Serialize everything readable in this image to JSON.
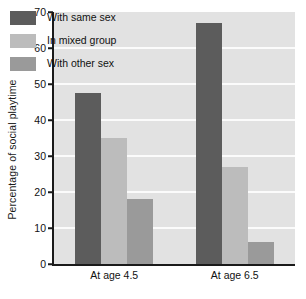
{
  "chart_data": {
    "type": "bar",
    "title": "",
    "subtitle": "",
    "xlabel": "",
    "ylabel": "Percentage of social playtime",
    "categories": [
      "At age 4.5",
      "At age 6.5"
    ],
    "series": [
      {
        "name": "With same sex",
        "values": [
          47.5,
          67.0
        ],
        "color": "#5c5c5c"
      },
      {
        "name": "In mixed group",
        "values": [
          35.0,
          27.0
        ],
        "color": "#bcbcbc"
      },
      {
        "name": "With other sex",
        "values": [
          18.0,
          6.0
        ],
        "color": "#9a9a9a"
      }
    ],
    "ylim": [
      0,
      70
    ],
    "yticks": [
      0,
      10,
      20,
      30,
      40,
      50,
      60,
      70
    ],
    "ytick_labels": [
      "0",
      "10",
      "20",
      "30",
      "40",
      "50",
      "60",
      "70"
    ],
    "grid": "horizontal-white",
    "legend_position": "inside-top-left",
    "plot_background": "#e2e2e2",
    "gridline_color": "#fbfbfb",
    "axis_color": "#1a1a1a",
    "figure_background": "#ffffff"
  }
}
